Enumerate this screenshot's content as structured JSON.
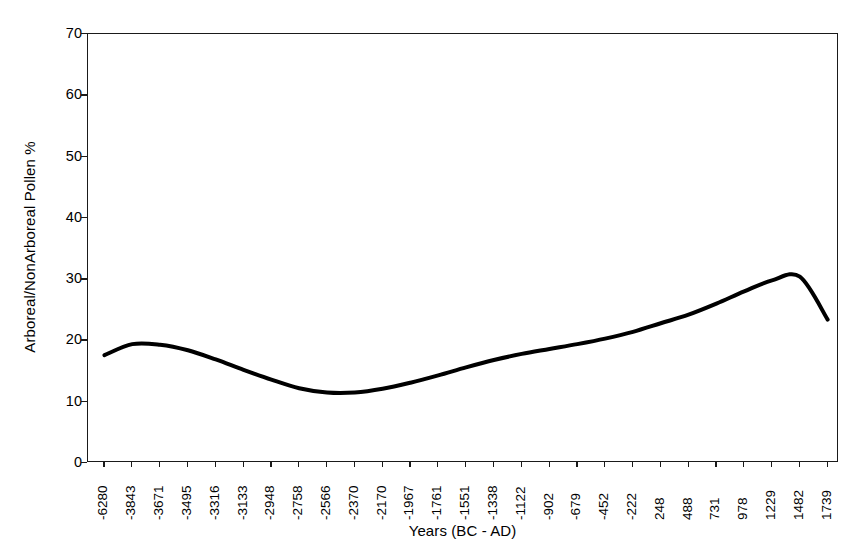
{
  "chart_data": {
    "type": "line",
    "title": "",
    "xlabel": "Years (BC - AD)",
    "ylabel": "Arboreal/NonArboreal Pollen %",
    "ylim": [
      0,
      70
    ],
    "y_ticks": [
      0,
      10,
      20,
      30,
      40,
      50,
      60,
      70
    ],
    "grid": false,
    "legend": "none",
    "line_color": "#000000",
    "line_width_px": 4,
    "categories": [
      "-6280",
      "-3843",
      "-3671",
      "-3495",
      "-3316",
      "-3133",
      "-2948",
      "-2758",
      "-2566",
      "-2370",
      "-2170",
      "-1967",
      "-1761",
      "-1551",
      "-1338",
      "-1122",
      "-902",
      "-679",
      "-452",
      "-222",
      "248",
      "488",
      "731",
      "978",
      "1229",
      "1482",
      "1739"
    ],
    "values": [
      17.6,
      19.4,
      19.3,
      18.4,
      16.9,
      15.2,
      13.6,
      12.2,
      11.5,
      11.5,
      12.1,
      13.1,
      14.3,
      15.6,
      16.8,
      17.8,
      18.6,
      19.4,
      20.3,
      21.4,
      22.8,
      24.2,
      26.0,
      28.0,
      29.8,
      30.4,
      23.4
    ],
    "x_axis_label_rotation_deg": -90,
    "notes": {
      "series_min": 11.4,
      "series_max": 30.4,
      "series_start": 17.6,
      "series_end": 23.4
    }
  }
}
